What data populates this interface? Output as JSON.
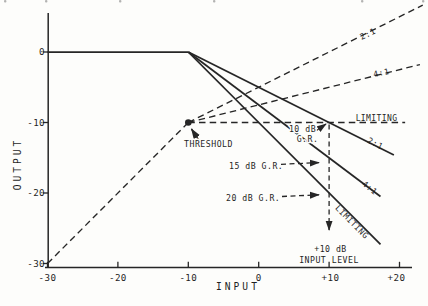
{
  "figure": {
    "paper_color": "#fdfdfb",
    "ink_color": "#262626"
  },
  "chart_data": {
    "type": "line",
    "title": "",
    "xlabel": "INPUT",
    "ylabel": "OUTPUT",
    "xlim": [
      -30,
      23.5
    ],
    "ylim": [
      -30,
      7
    ],
    "grid": "off",
    "x_ticks": [
      {
        "v": -30,
        "label": "-30"
      },
      {
        "v": -20,
        "label": "-20"
      },
      {
        "v": -10,
        "label": "-10"
      },
      {
        "v": 0,
        "label": "0"
      },
      {
        "v": 10,
        "label": "+10"
      },
      {
        "v": 20,
        "label": "+20"
      }
    ],
    "y_ticks": [
      {
        "v": 0,
        "label": "0"
      },
      {
        "v": -10,
        "label": "-10"
      },
      {
        "v": -20,
        "label": "-20"
      },
      {
        "v": -30,
        "label": "-30"
      }
    ],
    "threshold": {
      "input_db": -10,
      "output_db": -10,
      "label": "THRESHOLD"
    },
    "series": [
      {
        "id": "io_unity",
        "name": "input-output 1:1 below threshold",
        "ratio": "1:1",
        "style": "dashed",
        "points": [
          [
            -30,
            -30
          ],
          [
            -10,
            -10
          ]
        ]
      },
      {
        "id": "io_2to1",
        "name": "output curve 2:1 compression",
        "ratio": "2:1",
        "style": "dashed",
        "points": [
          [
            -10,
            -10
          ],
          [
            23.3,
            6.65
          ]
        ]
      },
      {
        "id": "io_4to1",
        "name": "output curve 4:1 compression",
        "ratio": "4:1",
        "style": "dashed",
        "points": [
          [
            -10,
            -10
          ],
          [
            22.9,
            -1.78
          ]
        ]
      },
      {
        "id": "io_limiting",
        "name": "output curve limiting",
        "ratio": "LIMITING",
        "style": "dashed",
        "points": [
          [
            -10,
            -10
          ],
          [
            20.8,
            -10
          ]
        ]
      },
      {
        "id": "gain_unity",
        "name": "gain 0 dB below threshold",
        "ratio": "1:1",
        "style": "solid",
        "points": [
          [
            -30,
            0
          ],
          [
            -10,
            0
          ]
        ]
      },
      {
        "id": "gain_2to1",
        "name": "gain curve 2:1 compression",
        "ratio": "2:1",
        "style": "solid",
        "points": [
          [
            -10,
            0
          ],
          [
            19.2,
            -14.6
          ]
        ]
      },
      {
        "id": "gain_4to1",
        "name": "gain curve 4:1 compression",
        "ratio": "4:1",
        "style": "solid",
        "points": [
          [
            -10,
            0
          ],
          [
            17.3,
            -20.5
          ]
        ]
      },
      {
        "id": "gain_limiting",
        "name": "gain curve limiting",
        "ratio": "LIMITING",
        "style": "solid",
        "points": [
          [
            -10,
            0
          ],
          [
            17.3,
            -27.3
          ]
        ]
      }
    ],
    "gain_reduction_points": [
      {
        "input_db": 10,
        "gain_db": -10,
        "label": "10 dB G.R."
      },
      {
        "input_db": 10,
        "gain_db": -15,
        "label": "15 dB G.R."
      },
      {
        "input_db": 10,
        "gain_db": -20,
        "label": "20 dB G.R."
      }
    ],
    "annotations": {
      "ratio_2to1_output": "2:1",
      "ratio_4to1_output": "4:1",
      "limiting_output": "LIMITING",
      "ratio_2to1_gain": "2:1",
      "ratio_4to1_gain": "4:1",
      "limiting_gain": "LIMITING",
      "threshold": "THRESHOLD",
      "gr10_line1": "10 dB",
      "gr10_line2": "G.R.",
      "gr15": "15 dB G.R.",
      "gr20": "20 dB G.R.",
      "input_level_line1": "+10 dB",
      "input_level_line2": "INPUT LEVEL"
    },
    "legend": "none"
  },
  "scan_artifacts": {
    "top_edge_fragment_x": [
      4,
      45,
      119,
      213,
      361,
      422
    ]
  }
}
